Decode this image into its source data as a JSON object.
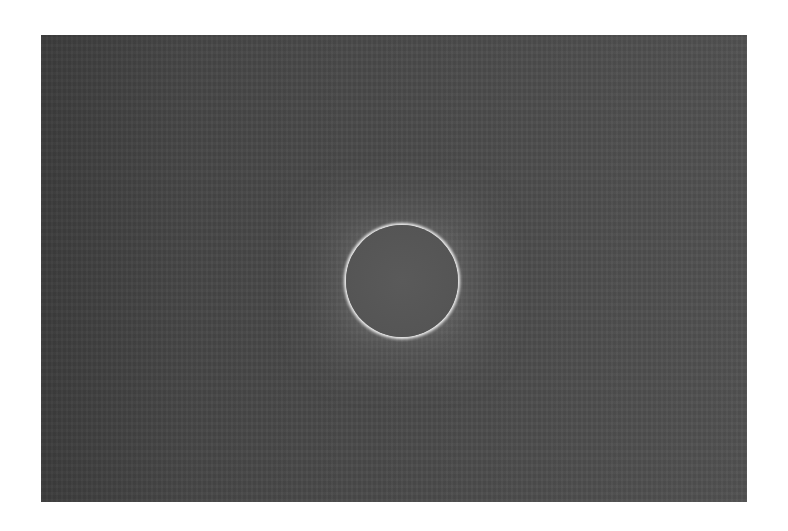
{
  "image": {
    "subject": "Total solar eclipse",
    "description": "Grayscale photograph of a total solar eclipse: dark moon disk surrounded by a bright corona ring on a dark noisy sky background",
    "colors": {
      "background": "#ffffff",
      "sky": "#4a4a4a",
      "moon": "#555555",
      "corona": "#f0f0f0"
    }
  }
}
